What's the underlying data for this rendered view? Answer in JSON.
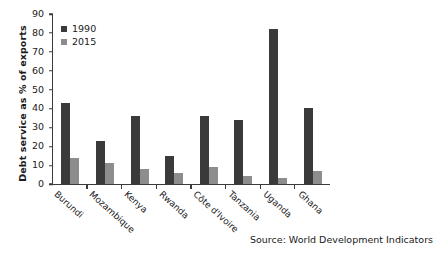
{
  "chart_data": {
    "type": "bar",
    "title": "",
    "xlabel": "",
    "ylabel": "Debt service as % of exports",
    "ylim": [
      0,
      90
    ],
    "ytick_step": 10,
    "yticks": [
      90,
      80,
      70,
      60,
      50,
      40,
      30,
      20,
      10,
      0
    ],
    "grid": false,
    "legend_position": "top-left",
    "categories": [
      "Burundi",
      "Mozambique",
      "Kenya",
      "Rwanda",
      "Côte d'Ivoire",
      "Tanzania",
      "Uganda",
      "Ghana"
    ],
    "series": [
      {
        "name": "1990",
        "color": "#3a3a3a",
        "values": [
          43,
          23,
          36,
          15,
          36,
          34,
          82,
          40
        ]
      },
      {
        "name": "2015",
        "color": "#8d8d8d",
        "values": [
          14,
          11,
          8,
          6,
          9,
          4,
          3,
          7
        ]
      }
    ],
    "annotations": [
      "Source: World Development Indicators"
    ]
  },
  "legend": {
    "items": [
      {
        "label": "1990"
      },
      {
        "label": "2015"
      }
    ]
  },
  "source": {
    "text": "Source: World Development Indicators"
  }
}
